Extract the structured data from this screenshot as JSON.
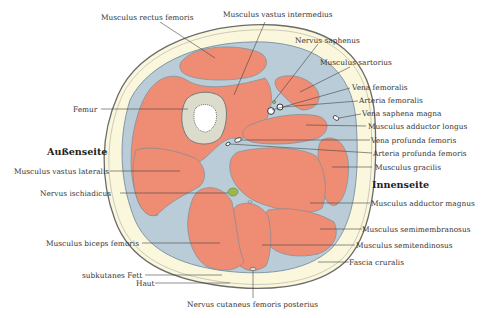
{
  "figure": {
    "type": "anatomical-cross-section",
    "colors": {
      "skin": "#6b6b6b",
      "subcutaneous_fat": "#fbf7dc",
      "fascia": "#b9ccd8",
      "muscle": "#ef8c74",
      "bone": "#dcdccc",
      "marrow": "#ffffff",
      "nerve": "#9ab74a",
      "leader_line": "#444444"
    }
  },
  "sides": {
    "lateral": "Außenseite",
    "medial": "Innenseite"
  },
  "labels": {
    "rectus_femoris": "Musculus rectus femoris",
    "vastus_intermedius": "Musculus vastus intermedius",
    "nervus_saphenus": "Nervus saphenus",
    "sartorius": "Musculus sartorius",
    "vena_femoralis": "Vena femoralis",
    "arteria_femoralis": "Arteria femoralis",
    "vena_saphena_magna": "Vena saphena magna",
    "adductor_longus": "Musculus adductor longus",
    "vena_profunda": "Vena profunda femoris",
    "arteria_profunda": "Arteria profunda femoris",
    "gracilis": "Musculus gracilis",
    "adductor_magnus": "Musculus adductor magnus",
    "semimembranosus": "Musculus semimembranosus",
    "semitendinosus": "Musculus semitendinosus",
    "fascia_cruralis": "Fascia cruralis",
    "femur": "Femur",
    "vastus_lateralis": "Musculus vastus lateralis",
    "ischiadicus": "Nervus ischiadicus",
    "biceps_femoris": "Musculus biceps femoris",
    "subkutanes_fett": "subkutanes Fett",
    "haut": "Haut",
    "cutaneus_posterior": "Nervus cutaneus femoris posterius"
  }
}
